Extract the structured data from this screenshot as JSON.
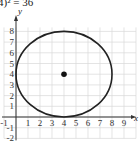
{
  "equation_text": "4)² = 36",
  "chart_data": {
    "type": "scatter",
    "title": "4)² = 36",
    "xlabel": "x",
    "ylabel": "y",
    "xlim": [
      -1,
      10
    ],
    "ylim": [
      -2,
      8
    ],
    "grid": true,
    "x_tick_labels": [
      "-1",
      "1",
      "2",
      "3",
      "4",
      "5",
      "6",
      "7",
      "8",
      "9"
    ],
    "y_tick_labels": [
      "-2",
      "-1",
      "1",
      "2",
      "3",
      "4",
      "5",
      "6",
      "7",
      "8"
    ],
    "shapes": [
      {
        "kind": "circle",
        "center": [
          4,
          4
        ],
        "radius": 4
      }
    ],
    "points": [
      {
        "x": 4,
        "y": 4,
        "label": "center"
      }
    ]
  },
  "colors": {
    "grid": "#d8d8d8",
    "axis": "#333333",
    "curve": "#222222"
  }
}
